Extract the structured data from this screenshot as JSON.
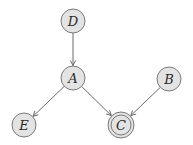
{
  "diagram": {
    "type": "directed-graph",
    "colors": {
      "node_fill": "#e3e3e3",
      "node_stroke": "#7a7a7a",
      "edge": "#6a6a6a",
      "label": "#2a2a2a"
    },
    "nodes": [
      {
        "id": "D",
        "label": "D",
        "observed": false
      },
      {
        "id": "A",
        "label": "A",
        "observed": false
      },
      {
        "id": "B",
        "label": "B",
        "observed": false
      },
      {
        "id": "E",
        "label": "E",
        "observed": false
      },
      {
        "id": "C",
        "label": "C",
        "observed": true,
        "double_border": true
      }
    ],
    "edges": [
      {
        "from": "D",
        "to": "A"
      },
      {
        "from": "A",
        "to": "E"
      },
      {
        "from": "A",
        "to": "C"
      },
      {
        "from": "B",
        "to": "C"
      }
    ]
  }
}
